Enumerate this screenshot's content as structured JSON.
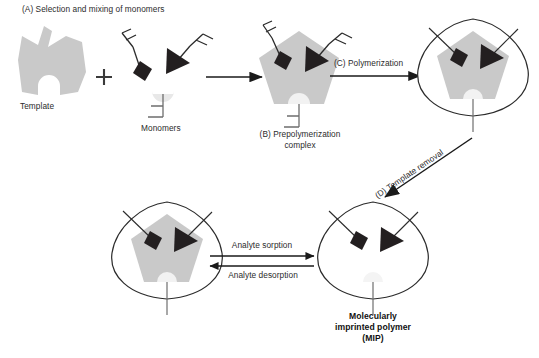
{
  "figure": {
    "type": "process-diagram",
    "background_color": "#ffffff"
  },
  "palette": {
    "template_gray": "#c9c9c9",
    "monomer_dark": "#231f20",
    "monomer_light": "#e8e8e8",
    "stroke": "#2b2b2b",
    "text": "#2b2b2b",
    "text_bold": "#111111"
  },
  "steps": {
    "a_label": "(A) Selection and mixing of monomers",
    "template_label": "Template",
    "plus_sign": "+",
    "monomers_label": "Monomers",
    "b_label_line1": "(B) Prepolymerization",
    "b_label_line2": "complex",
    "c_label": "(C) Polymerization",
    "d_label": "(D) Template removal",
    "sorption_label": "Analyte sorption",
    "desorption_label": "Analyte desorption",
    "mip_label_line1": "Molecularly",
    "mip_label_line2": "imprinted polymer",
    "mip_label_line3": "(MIP)"
  },
  "entities": {
    "template": {
      "name": "template-molecule",
      "shape": "notched-pentagon",
      "fill": "#c9c9c9",
      "binding_sites": 3
    },
    "monomers": [
      {
        "name": "square-monomer",
        "shape": "diamond",
        "fill": "#231f20"
      },
      {
        "name": "triangle-monomer",
        "shape": "triangle",
        "fill": "#231f20"
      },
      {
        "name": "semicircle-monomer",
        "shape": "semicircle",
        "fill": "#e8e8e8"
      }
    ],
    "polymer": {
      "name": "polymer-matrix",
      "shape": "rounded-triangle",
      "fill": "none",
      "stroke": "#2b2b2b"
    },
    "cavity": {
      "name": "imprinted-cavity",
      "state": "empty"
    }
  },
  "arrows": {
    "mixing": "right",
    "polymerization": "right",
    "template_removal": "down-left-diagonal",
    "sorption": "right",
    "desorption": "left"
  }
}
